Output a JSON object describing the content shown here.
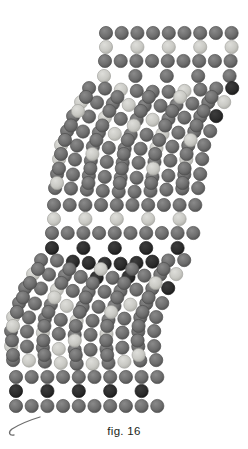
{
  "figure": {
    "caption": "fig. 16",
    "background_color": "#ffffff",
    "width": 248,
    "height": 449
  },
  "bead_palette": {
    "dark": "#2b2b2b",
    "medium": "#6d6d6d",
    "light": "#c9c9c4",
    "rim_dark": "#1d1d1d",
    "rim_medium": "#4f4f4f",
    "rim_light": "#a5a5a0"
  },
  "bead_geometry": {
    "radius": 6.6,
    "column_spacing": 15.7,
    "row_spacing": 14.4,
    "slant_per_row": -1.45,
    "origin_x": 106,
    "origin_y": 33
  },
  "thread": {
    "color": "#6d6d6d",
    "tail_label": "working-thread-tail",
    "tail_path": "M 40 417 C 30 420, 20 424, 12 429 C 8 432, 9 436, 14 435"
  },
  "structure": {
    "description": "Parallelogram beaded panel of horizontal bands alternating with open netted loop sections; panel slants left as rows descend.",
    "band_count": 14
  },
  "chart_data": {
    "type": "heatmap",
    "title": "fig. 16",
    "xlabel": "",
    "ylabel": "",
    "legend": [
      "dark",
      "medium",
      "light"
    ],
    "note": "Each row is a bead row; values are bead tone codes. 0=empty, 1=dark, 2=medium, 3=light.",
    "rows": [
      {
        "y": 33,
        "x0": 106,
        "kind": "solid",
        "values": [
          2,
          2,
          2,
          2,
          2,
          2,
          2,
          2,
          2
        ]
      },
      {
        "y": 47,
        "x0": 106,
        "kind": "alt",
        "values": [
          3,
          0,
          3,
          0,
          3,
          0,
          3,
          0,
          3
        ]
      },
      {
        "y": 61,
        "x0": 105,
        "kind": "solid",
        "values": [
          2,
          2,
          2,
          2,
          2,
          2,
          2,
          2,
          2
        ]
      },
      {
        "y": 76,
        "x0": 104,
        "kind": "alt",
        "values": [
          3,
          0,
          2,
          0,
          2,
          0,
          2,
          0,
          2
        ]
      },
      {
        "y": 90,
        "x0": 90,
        "kind": "net",
        "values": [
          2,
          2,
          3,
          2,
          2,
          2,
          3,
          2,
          2,
          1
        ]
      },
      {
        "y": 104,
        "x0": 82,
        "kind": "net",
        "values": [
          3,
          2,
          2,
          3,
          2,
          2,
          2,
          2,
          2,
          3
        ]
      },
      {
        "y": 118,
        "x0": 74,
        "kind": "net",
        "values": [
          2,
          2,
          3,
          2,
          2,
          3,
          2,
          2,
          2,
          1
        ]
      },
      {
        "y": 133,
        "x0": 68,
        "kind": "net",
        "values": [
          2,
          2,
          2,
          3,
          2,
          2,
          3,
          2,
          2,
          2
        ]
      },
      {
        "y": 147,
        "x0": 62,
        "kind": "net",
        "values": [
          3,
          2,
          2,
          2,
          2,
          2,
          3,
          2,
          2,
          2
        ]
      },
      {
        "y": 161,
        "x0": 60,
        "kind": "net",
        "values": [
          3,
          2,
          2,
          2,
          2,
          2,
          2,
          2,
          3,
          2
        ]
      },
      {
        "y": 176,
        "x0": 58,
        "kind": "net",
        "values": [
          2,
          2,
          2,
          2,
          2,
          2,
          2,
          2,
          2,
          2
        ]
      },
      {
        "y": 190,
        "x0": 56,
        "kind": "net",
        "values": [
          2,
          2,
          2,
          2,
          2,
          2,
          2,
          2,
          2,
          2
        ]
      },
      {
        "y": 205,
        "x0": 54,
        "kind": "solid",
        "values": [
          2,
          2,
          2,
          2,
          2,
          2,
          2,
          2,
          2,
          2
        ]
      },
      {
        "y": 219,
        "x0": 54,
        "kind": "alt",
        "values": [
          3,
          0,
          3,
          0,
          3,
          0,
          3,
          0,
          3,
          0
        ]
      },
      {
        "y": 233,
        "x0": 52,
        "kind": "solid",
        "values": [
          2,
          2,
          2,
          2,
          2,
          2,
          2,
          2,
          2,
          2
        ]
      },
      {
        "y": 248,
        "x0": 52,
        "kind": "alt",
        "values": [
          1,
          0,
          1,
          0,
          1,
          0,
          1,
          0,
          1,
          0
        ]
      },
      {
        "y": 262,
        "x0": 42,
        "kind": "net",
        "values": [
          2,
          2,
          1,
          1,
          1,
          1,
          1,
          1,
          2,
          2
        ]
      },
      {
        "y": 276,
        "x0": 34,
        "kind": "net",
        "values": [
          3,
          2,
          2,
          2,
          1,
          2,
          1,
          2,
          2,
          3
        ]
      },
      {
        "y": 290,
        "x0": 26,
        "kind": "net",
        "values": [
          2,
          2,
          3,
          2,
          2,
          2,
          2,
          2,
          2,
          1
        ]
      },
      {
        "y": 305,
        "x0": 20,
        "kind": "net",
        "values": [
          2,
          2,
          2,
          3,
          2,
          2,
          2,
          3,
          2,
          2
        ]
      },
      {
        "y": 319,
        "x0": 14,
        "kind": "net",
        "values": [
          3,
          2,
          2,
          2,
          3,
          2,
          2,
          2,
          2,
          2
        ]
      },
      {
        "y": 333,
        "x0": 12,
        "kind": "net",
        "values": [
          2,
          2,
          3,
          2,
          2,
          2,
          3,
          2,
          2,
          2
        ]
      },
      {
        "y": 348,
        "x0": 12,
        "kind": "net",
        "values": [
          3,
          2,
          2,
          3,
          2,
          2,
          2,
          2,
          2,
          2
        ]
      },
      {
        "y": 362,
        "x0": 14,
        "kind": "net",
        "values": [
          2,
          3,
          2,
          3,
          2,
          3,
          2,
          3,
          2,
          2
        ]
      },
      {
        "y": 377,
        "x0": 16,
        "kind": "solid",
        "values": [
          2,
          2,
          2,
          2,
          2,
          2,
          2,
          2,
          2,
          2
        ]
      },
      {
        "y": 391,
        "x0": 16,
        "kind": "alt",
        "values": [
          1,
          0,
          1,
          0,
          1,
          0,
          1,
          0,
          1,
          0
        ]
      },
      {
        "y": 406,
        "x0": 16,
        "kind": "solid",
        "values": [
          2,
          2,
          2,
          2,
          2,
          2,
          2,
          2,
          2,
          2
        ]
      }
    ]
  }
}
